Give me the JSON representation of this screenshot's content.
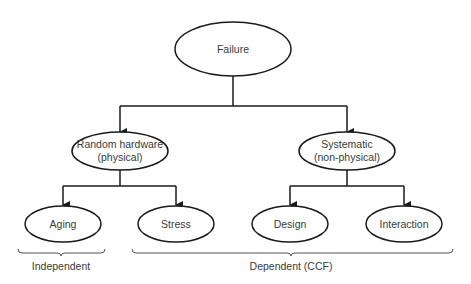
{
  "diagram": {
    "type": "tree",
    "root": {
      "label": "Failure",
      "children": [
        {
          "label_line1": "Random hardware",
          "label_line2": "(physical)",
          "children": [
            {
              "label": "Aging"
            },
            {
              "label": "Stress"
            }
          ]
        },
        {
          "label_line1": "Systematic",
          "label_line2": "(non-physical)",
          "children": [
            {
              "label": "Design"
            },
            {
              "label": "Interaction"
            }
          ]
        }
      ]
    },
    "groups": [
      {
        "label": "Independent",
        "covers": [
          "Aging"
        ]
      },
      {
        "label": "Dependent (CCF)",
        "covers": [
          "Stress",
          "Design",
          "Interaction"
        ]
      }
    ],
    "colors": {
      "line": "#1a1a1a",
      "text": "#3a3a3a",
      "brace": "#555555",
      "background": "#ffffff"
    }
  }
}
